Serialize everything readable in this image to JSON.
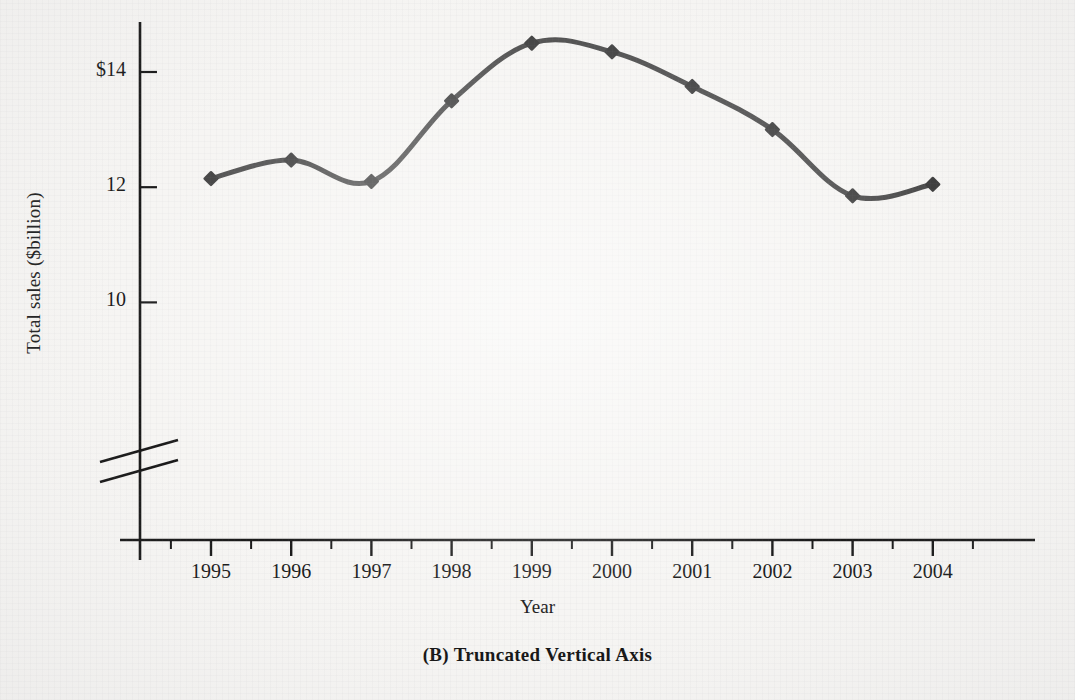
{
  "figure": {
    "caption": "(B) Truncated Vertical Axis"
  },
  "chart_data": {
    "type": "line",
    "title": "(B) Truncated Vertical Axis",
    "xlabel": "Year",
    "ylabel": "Total sales ($billion)",
    "categories": [
      "1995",
      "1996",
      "1997",
      "1998",
      "1999",
      "2000",
      "2001",
      "2002",
      "2003",
      "2004"
    ],
    "values": [
      12.15,
      12.47,
      12.1,
      13.5,
      14.5,
      14.35,
      13.75,
      13.0,
      11.85,
      12.05
    ],
    "series": [
      {
        "name": "Total sales",
        "values": [
          12.15,
          12.47,
          12.1,
          13.5,
          14.5,
          14.35,
          13.75,
          13.0,
          11.85,
          12.05
        ]
      }
    ],
    "ytick_labels": [
      "$14",
      "12",
      "10"
    ],
    "ytick_values": [
      14,
      12,
      10
    ],
    "ylim": [
      9.1,
      14.85
    ],
    "xlim": [
      "1995",
      "2004"
    ],
    "grid": false,
    "legend": false,
    "axis_break": true,
    "axis_break_note": "vertical axis truncated below 10",
    "line_color": "#4a4a4a",
    "marker_color": "#3f3f3f",
    "marker_shape": "diamond",
    "smoothing": "spline",
    "axis_color": "#1a1a1a",
    "background_color": "#f6f5f3"
  },
  "yaxis": {
    "title": "Total sales ($billion)",
    "ticks": [
      {
        "label": "$14",
        "value": 14
      },
      {
        "label": "12",
        "value": 12
      },
      {
        "label": "10",
        "value": 10
      }
    ]
  },
  "xaxis": {
    "title": "Year",
    "ticks": [
      {
        "label": "1995"
      },
      {
        "label": "1996"
      },
      {
        "label": "1997"
      },
      {
        "label": "1998"
      },
      {
        "label": "1999"
      },
      {
        "label": "2000"
      },
      {
        "label": "2001"
      },
      {
        "label": "2002"
      },
      {
        "label": "2003"
      },
      {
        "label": "2004"
      }
    ]
  }
}
